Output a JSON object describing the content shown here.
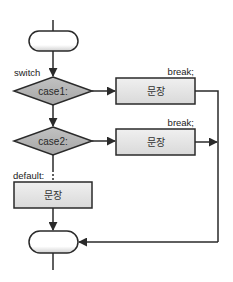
{
  "diagram": {
    "type": "flowchart",
    "labels": {
      "switch": "switch",
      "default": "default:"
    },
    "cases": [
      {
        "label": "case1:",
        "statement": "문장",
        "break_label": "break;"
      },
      {
        "label": "case2:",
        "statement": "문장",
        "break_label": "break;"
      }
    ],
    "default_statement": "문장",
    "colors": {
      "stroke": "#2a2a2a",
      "diamond_fill": "#b3b3b3",
      "box_fill": "#e6e6e6",
      "terminator_fill": "#ffffff"
    }
  }
}
